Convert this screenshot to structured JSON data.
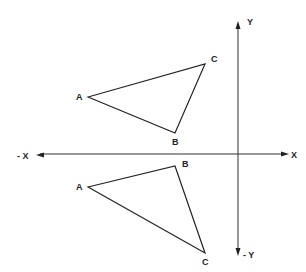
{
  "diagram": {
    "axes": {
      "x_positive_label": "X",
      "x_negative_label": "- X",
      "y_positive_label": "Y",
      "y_negative_label": "- Y"
    },
    "triangles": [
      {
        "name": "original",
        "vertices": [
          {
            "label": "A",
            "x": -5.0,
            "y": 1.9
          },
          {
            "label": "B",
            "x": -2.1,
            "y": 0.7
          },
          {
            "label": "C",
            "x": -1.1,
            "y": 3.0
          }
        ]
      },
      {
        "name": "reflected",
        "vertices": [
          {
            "label": "A",
            "x": -5.0,
            "y": -1.1
          },
          {
            "label": "B",
            "x": -2.1,
            "y": -0.4
          },
          {
            "label": "C",
            "x": -1.1,
            "y": -3.3
          }
        ]
      }
    ]
  }
}
